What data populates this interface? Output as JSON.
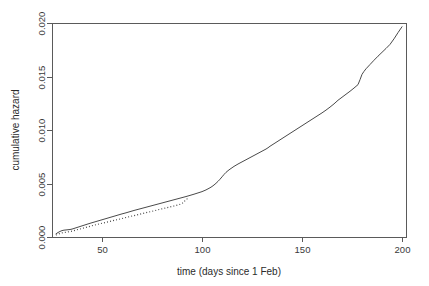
{
  "chart_data": {
    "type": "line",
    "title": "",
    "xlabel": "time (days since 1 Feb)",
    "ylabel": "cumulative hazard",
    "xlim": [
      25,
      202
    ],
    "ylim": [
      0.0,
      0.02
    ],
    "xticks": [
      50,
      100,
      150,
      200
    ],
    "xtick_labels": [
      "50",
      "100",
      "150",
      "200"
    ],
    "yticks": [
      0.0,
      0.005,
      0.01,
      0.015,
      0.02
    ],
    "ytick_labels": [
      "0.000",
      "0.005",
      "0.010",
      "0.015",
      "0.020"
    ],
    "grid": false,
    "legend": "none",
    "box": true,
    "series": [
      {
        "name": "cumulative hazard (solid)",
        "style": "solid",
        "x": [
          27,
          28,
          29,
          30,
          31,
          32,
          33,
          34,
          35,
          36,
          37,
          38,
          39,
          40,
          42,
          44,
          46,
          48,
          50,
          52,
          54,
          56,
          58,
          60,
          62,
          64,
          66,
          68,
          70,
          72,
          74,
          76,
          78,
          80,
          82,
          84,
          86,
          88,
          90,
          92,
          94,
          96,
          98,
          100,
          102,
          104,
          105,
          106,
          107,
          108,
          109,
          110,
          111,
          112,
          113,
          114,
          116,
          118,
          120,
          122,
          124,
          126,
          128,
          130,
          132,
          133,
          134,
          136,
          138,
          140,
          142,
          144,
          146,
          148,
          150,
          152,
          154,
          156,
          158,
          160,
          162,
          164,
          166,
          168,
          170,
          172,
          174,
          176,
          178,
          179,
          180,
          181,
          182,
          184,
          186,
          188,
          190,
          192,
          194,
          196,
          198,
          200
        ],
        "y": [
          0.0003,
          0.00042,
          0.00052,
          0.0006,
          0.00064,
          0.00066,
          0.00068,
          0.0007,
          0.00074,
          0.0008,
          0.00086,
          0.00092,
          0.00098,
          0.00104,
          0.00116,
          0.00128,
          0.00139,
          0.0015,
          0.00161,
          0.00172,
          0.00183,
          0.00194,
          0.00205,
          0.00216,
          0.00226,
          0.00237,
          0.00248,
          0.00258,
          0.00268,
          0.00278,
          0.00288,
          0.00298,
          0.00308,
          0.00318,
          0.00328,
          0.00338,
          0.00348,
          0.00358,
          0.00368,
          0.00378,
          0.00389,
          0.004,
          0.00412,
          0.00424,
          0.0044,
          0.0046,
          0.00472,
          0.00486,
          0.00502,
          0.0052,
          0.0054,
          0.00562,
          0.00584,
          0.00604,
          0.0062,
          0.00634,
          0.0066,
          0.00682,
          0.00702,
          0.00722,
          0.00742,
          0.00762,
          0.00782,
          0.00802,
          0.00822,
          0.00834,
          0.00848,
          0.00872,
          0.00896,
          0.0092,
          0.00944,
          0.00968,
          0.00992,
          0.01016,
          0.0104,
          0.01064,
          0.01088,
          0.01112,
          0.01136,
          0.0116,
          0.01186,
          0.01214,
          0.01244,
          0.01278,
          0.01306,
          0.01334,
          0.01362,
          0.01392,
          0.01424,
          0.0147,
          0.0152,
          0.01548,
          0.01572,
          0.01612,
          0.01652,
          0.0169,
          0.01726,
          0.01762,
          0.018,
          0.01852,
          0.0191,
          0.01965
        ]
      },
      {
        "name": "cumulative hazard (dotted)",
        "style": "dotted",
        "x": [
          27,
          28,
          29,
          30,
          31,
          32,
          33,
          34,
          35,
          36,
          37,
          38,
          39,
          40,
          42,
          44,
          46,
          48,
          50,
          52,
          54,
          56,
          58,
          60,
          62,
          64,
          66,
          68,
          70,
          72,
          74,
          76,
          78,
          80,
          82,
          84,
          86,
          88,
          90,
          91,
          92,
          93
        ],
        "y": [
          0.00018,
          0.00026,
          0.00033,
          0.00038,
          0.00042,
          0.00045,
          0.00048,
          0.00051,
          0.00055,
          0.0006,
          0.00065,
          0.0007,
          0.00075,
          0.0008,
          0.0009,
          0.001,
          0.0011,
          0.00119,
          0.00128,
          0.00137,
          0.00146,
          0.00155,
          0.00164,
          0.00173,
          0.00182,
          0.00191,
          0.002,
          0.00209,
          0.00218,
          0.00227,
          0.00236,
          0.00245,
          0.00254,
          0.00263,
          0.00272,
          0.00281,
          0.0029,
          0.003,
          0.00312,
          0.0033,
          0.0035,
          0.00362
        ]
      }
    ]
  },
  "axes": {
    "plot_box": {
      "left": 52,
      "right": 406,
      "top": 23,
      "bottom": 237
    }
  }
}
